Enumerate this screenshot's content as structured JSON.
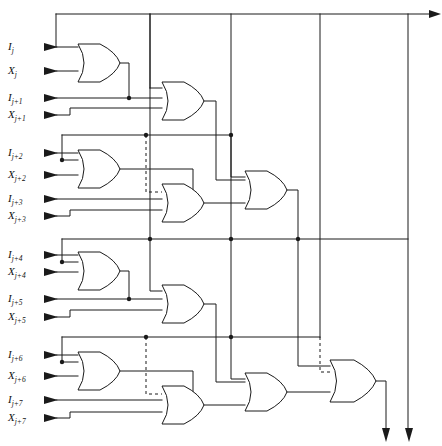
{
  "figure": {
    "kind": "logic-circuit-diagram",
    "width": 442,
    "height": 446,
    "line_color": "#1a1a1a",
    "background_color": "#ffffff"
  },
  "inputs": [
    {
      "id": "in-0",
      "base": "I",
      "sub": "j",
      "label": "Ij",
      "y": 47
    },
    {
      "id": "in-1",
      "base": "X",
      "sub": "j",
      "label": "Xj",
      "y": 71
    },
    {
      "id": "in-2",
      "base": "I",
      "sub": "j+1",
      "label": "Ij+1",
      "y": 98
    },
    {
      "id": "in-3",
      "base": "X",
      "sub": "j+1",
      "label": "Xj+1",
      "y": 115
    },
    {
      "id": "in-4",
      "base": "I",
      "sub": "j+2",
      "label": "Ij+2",
      "y": 153
    },
    {
      "id": "in-5",
      "base": "X",
      "sub": "j+2",
      "label": "Xj+2",
      "y": 175
    },
    {
      "id": "in-6",
      "base": "I",
      "sub": "j+3",
      "label": "Ij+3",
      "y": 199
    },
    {
      "id": "in-7",
      "base": "X",
      "sub": "j+3",
      "label": "Xj+3",
      "y": 216
    },
    {
      "id": "in-8",
      "base": "I",
      "sub": "j+4",
      "label": "Ij+4",
      "y": 255
    },
    {
      "id": "in-9",
      "base": "X",
      "sub": "j+4",
      "label": "Xj+4",
      "y": 272
    },
    {
      "id": "in-10",
      "base": "I",
      "sub": "j+5",
      "label": "Ij+5",
      "y": 299
    },
    {
      "id": "in-11",
      "base": "X",
      "sub": "j+5",
      "label": "Xj+5",
      "y": 317
    },
    {
      "id": "in-12",
      "base": "I",
      "sub": "j+6",
      "label": "Ij+6",
      "y": 355
    },
    {
      "id": "in-13",
      "base": "X",
      "sub": "j+6",
      "label": "Xj+6",
      "y": 376
    },
    {
      "id": "in-14",
      "base": "I",
      "sub": "j+7",
      "label": "Ij+7",
      "y": 400
    },
    {
      "id": "in-15",
      "base": "X",
      "sub": "j+7",
      "label": "Xj+7",
      "y": 418
    }
  ],
  "gates": [
    {
      "id": "g1",
      "type": "OR",
      "stage": 1,
      "x": 78,
      "y": 44,
      "w": 42,
      "h": 38,
      "inputs": 2
    },
    {
      "id": "g2",
      "type": "OR",
      "stage": 2,
      "x": 162,
      "y": 82,
      "w": 42,
      "h": 38,
      "inputs": 3
    },
    {
      "id": "g3",
      "type": "OR",
      "stage": 1,
      "x": 78,
      "y": 150,
      "w": 42,
      "h": 38,
      "inputs": 2
    },
    {
      "id": "g4",
      "type": "OR",
      "stage": 2,
      "x": 162,
      "y": 184,
      "w": 42,
      "h": 38,
      "inputs": 3
    },
    {
      "id": "g5",
      "type": "OR",
      "stage": 3,
      "x": 245,
      "y": 171,
      "w": 42,
      "h": 38,
      "inputs": 3
    },
    {
      "id": "g6",
      "type": "OR",
      "stage": 1,
      "x": 78,
      "y": 252,
      "w": 42,
      "h": 38,
      "inputs": 2
    },
    {
      "id": "g7",
      "type": "OR",
      "stage": 2,
      "x": 162,
      "y": 285,
      "w": 42,
      "h": 38,
      "inputs": 3
    },
    {
      "id": "g8",
      "type": "OR",
      "stage": 1,
      "x": 78,
      "y": 352,
      "w": 42,
      "h": 38,
      "inputs": 2
    },
    {
      "id": "g9",
      "type": "OR",
      "stage": 2,
      "x": 162,
      "y": 386,
      "w": 42,
      "h": 38,
      "inputs": 3
    },
    {
      "id": "g10",
      "type": "OR",
      "stage": 3,
      "x": 245,
      "y": 373,
      "w": 42,
      "h": 38,
      "inputs": 3
    },
    {
      "id": "g11",
      "type": "OR",
      "stage": 4,
      "x": 330,
      "y": 360,
      "w": 46,
      "h": 42,
      "inputs": 3
    }
  ],
  "buses": {
    "top_rail_y": 14,
    "vertical_rails_x": [
      150,
      231,
      320,
      408
    ],
    "note": "Top horizontal rail feeds four vertical distribution lines"
  },
  "outputs": [
    {
      "id": "out-top",
      "direction": "right",
      "x": 437,
      "y": 14,
      "from": "top-rail"
    },
    {
      "id": "out-gate",
      "direction": "down",
      "x": 386,
      "y": 438,
      "from": "g11"
    },
    {
      "id": "out-bus",
      "direction": "down",
      "x": 409,
      "y": 438,
      "from": "rail-408"
    }
  ],
  "junction_dots": [
    {
      "x": 231,
      "y": 14
    },
    {
      "x": 320,
      "y": 14
    },
    {
      "x": 408,
      "y": 14
    },
    {
      "x": 150,
      "y": 14
    },
    {
      "x": 129,
      "y": 98
    },
    {
      "x": 146,
      "y": 135
    },
    {
      "x": 231,
      "y": 135
    },
    {
      "x": 62,
      "y": 160
    },
    {
      "x": 193,
      "y": 199
    },
    {
      "x": 150,
      "y": 239
    },
    {
      "x": 231,
      "y": 239
    },
    {
      "x": 298,
      "y": 239
    },
    {
      "x": 62,
      "y": 262
    },
    {
      "x": 129,
      "y": 299
    },
    {
      "x": 146,
      "y": 337
    },
    {
      "x": 231,
      "y": 337
    },
    {
      "x": 298,
      "y": 337
    },
    {
      "x": 62,
      "y": 362
    },
    {
      "x": 193,
      "y": 400
    }
  ],
  "dashed_connections": [
    {
      "id": "dash-1",
      "from_x": 146,
      "from_y": 135,
      "to_x": 162,
      "to_y": 192
    },
    {
      "id": "dash-2",
      "from_x": 298,
      "from_y": 239,
      "to_x": 298,
      "to_y": 330
    },
    {
      "id": "dash-3",
      "from_x": 146,
      "from_y": 337,
      "to_x": 162,
      "to_y": 394
    },
    {
      "id": "dash-4",
      "from_x": 320,
      "from_y": 337,
      "to_x": 330,
      "to_y": 368
    }
  ]
}
